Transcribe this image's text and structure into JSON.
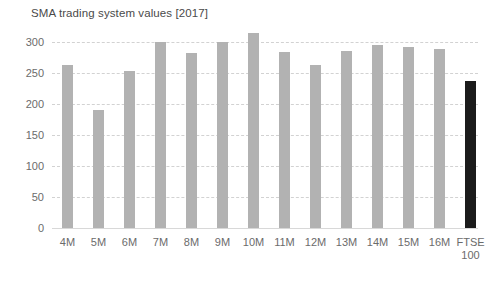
{
  "chart_data": {
    "type": "bar",
    "title": "SMA trading system values [2017]",
    "xlabel": "",
    "ylabel": "",
    "ylim": [
      0,
      325
    ],
    "yticks": [
      0,
      50,
      100,
      150,
      200,
      250,
      300
    ],
    "ytick_labels": [
      "0",
      "50",
      "100",
      "150",
      "200",
      "250",
      "300"
    ],
    "grid": true,
    "grid_axis": "y",
    "grid_style": "dashed",
    "legend": "none",
    "categories": [
      "4M",
      "5M",
      "6M",
      "7M",
      "8M",
      "9M",
      "10M",
      "11M",
      "12M",
      "13M",
      "14M",
      "15M",
      "16M",
      "FTSE\n100"
    ],
    "values": [
      263,
      190,
      252,
      299,
      281,
      299,
      313,
      283,
      263,
      284,
      294,
      292,
      288,
      236
    ],
    "bar_colors": [
      "#b2b2b2",
      "#b2b2b2",
      "#b2b2b2",
      "#b2b2b2",
      "#b2b2b2",
      "#b2b2b2",
      "#b2b2b2",
      "#b2b2b2",
      "#b2b2b2",
      "#b2b2b2",
      "#b2b2b2",
      "#b2b2b2",
      "#b2b2b2",
      "#1b1b1b"
    ],
    "highlight_index": 13,
    "series": [
      {
        "name": "SMA trading system values",
        "values": [
          263,
          190,
          252,
          299,
          281,
          299,
          313,
          283,
          263,
          284,
          294,
          292,
          288,
          236
        ]
      }
    ]
  },
  "colors": {
    "bar_default": "#b2b2b2",
    "bar_highlight": "#1b1b1b",
    "gridline": "#d2d2d2",
    "text": "#6b6b6b",
    "background": "#ffffff"
  }
}
